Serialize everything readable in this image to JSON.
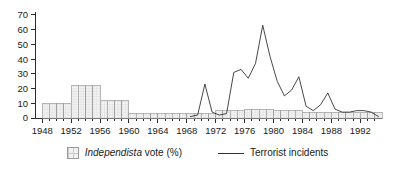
{
  "chart_data": {
    "type": "bar",
    "title": "",
    "subtitle": "",
    "xlabel": "",
    "ylabel": "",
    "xlim": [
      1947,
      1995
    ],
    "ylim": [
      0,
      72
    ],
    "yticks": [
      0,
      10,
      20,
      30,
      40,
      50,
      60,
      70
    ],
    "xticks": [
      1948,
      1952,
      1956,
      1960,
      1964,
      1968,
      1972,
      1976,
      1980,
      1984,
      1988,
      1992
    ],
    "xtick_labels": [
      "1948",
      "1952",
      "1956",
      "1960",
      "1964",
      "1968",
      "1972",
      "1976",
      "1980",
      "1984",
      "1988",
      "1992"
    ],
    "ytick_labels": [
      "0",
      "10",
      "20",
      "30",
      "40",
      "50",
      "60",
      "70"
    ],
    "grid": false,
    "legend_position": "bottom-center",
    "series": [
      {
        "name": "Independista vote (%)",
        "render": "bar",
        "style": "hatched-grey",
        "note": "step bars held constant across each 4-year election period",
        "categories": [
          1948,
          1949,
          1950,
          1951,
          1952,
          1953,
          1954,
          1955,
          1956,
          1957,
          1958,
          1959,
          1960,
          1961,
          1962,
          1963,
          1964,
          1965,
          1966,
          1967,
          1968,
          1969,
          1970,
          1971,
          1972,
          1973,
          1974,
          1975,
          1976,
          1977,
          1978,
          1979,
          1980,
          1981,
          1982,
          1983,
          1984,
          1985,
          1986,
          1987,
          1988,
          1989,
          1990,
          1991,
          1992,
          1993,
          1994
        ],
        "values": [
          10,
          10,
          10,
          10,
          22,
          22,
          22,
          22,
          12,
          12,
          12,
          12,
          3,
          3,
          3,
          3,
          3,
          3,
          3,
          3,
          3,
          3,
          3,
          3,
          5,
          5,
          5,
          5,
          6,
          6,
          6,
          6,
          5,
          5,
          5,
          5,
          4,
          4,
          4,
          4,
          4,
          4,
          4,
          4,
          4,
          4,
          4
        ]
      },
      {
        "name": "Terrorist incidents",
        "render": "line",
        "style": "thin-dark-line",
        "x": [
          1968,
          1969,
          1970,
          1971,
          1972,
          1973,
          1974,
          1975,
          1976,
          1977,
          1978,
          1979,
          1980,
          1981,
          1982,
          1983,
          1984,
          1985,
          1986,
          1987,
          1988,
          1989,
          1990,
          1991,
          1992,
          1993,
          1994
        ],
        "values": [
          1,
          2,
          23,
          4,
          2,
          3,
          31,
          33,
          27,
          37,
          63,
          42,
          25,
          15,
          19,
          28,
          8,
          5,
          9,
          17,
          6,
          4,
          4,
          5,
          5,
          4,
          1
        ]
      }
    ]
  },
  "legend": {
    "entries": [
      {
        "marker": "bar-swatch-icon",
        "label_italic": "Independista",
        "label_rest": " vote (%)"
      },
      {
        "marker": "line-swatch-icon",
        "label": "Terrorist incidents"
      }
    ]
  }
}
